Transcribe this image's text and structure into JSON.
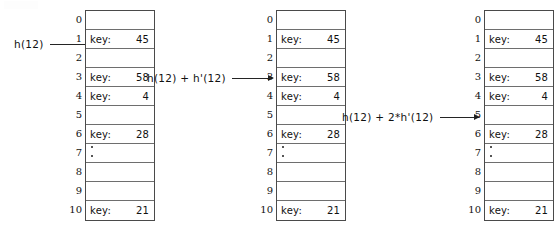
{
  "diagram": {
    "slot_label": "key:",
    "ink_color": "#111111",
    "border_color": "#4a4a4a",
    "background_color": "#ffffff"
  },
  "tables": [
    {
      "name": "hash-table-step-1",
      "slots": [
        {
          "index": "0",
          "key": "",
          "empty": true,
          "dots": false
        },
        {
          "index": "1",
          "key": "45",
          "empty": false,
          "dots": false
        },
        {
          "index": "2",
          "key": "",
          "empty": true,
          "dots": false
        },
        {
          "index": "3",
          "key": "58",
          "empty": false,
          "dots": false
        },
        {
          "index": "4",
          "key": "4",
          "empty": false,
          "dots": false
        },
        {
          "index": "5",
          "key": "",
          "empty": true,
          "dots": false
        },
        {
          "index": "6",
          "key": "28",
          "empty": false,
          "dots": false
        },
        {
          "index": "7",
          "key": "",
          "empty": true,
          "dots": true
        },
        {
          "index": "8",
          "key": "",
          "empty": true,
          "dots": false
        },
        {
          "index": "9",
          "key": "",
          "empty": true,
          "dots": false
        },
        {
          "index": "10",
          "key": "21",
          "empty": false,
          "dots": false
        }
      ]
    },
    {
      "name": "hash-table-step-2",
      "slots": [
        {
          "index": "0",
          "key": "",
          "empty": true,
          "dots": false
        },
        {
          "index": "1",
          "key": "45",
          "empty": false,
          "dots": false
        },
        {
          "index": "2",
          "key": "",
          "empty": true,
          "dots": false
        },
        {
          "index": "3",
          "key": "58",
          "empty": false,
          "dots": false
        },
        {
          "index": "4",
          "key": "4",
          "empty": false,
          "dots": false
        },
        {
          "index": "5",
          "key": "",
          "empty": true,
          "dots": false
        },
        {
          "index": "6",
          "key": "28",
          "empty": false,
          "dots": false
        },
        {
          "index": "7",
          "key": "",
          "empty": true,
          "dots": true
        },
        {
          "index": "8",
          "key": "",
          "empty": true,
          "dots": false
        },
        {
          "index": "9",
          "key": "",
          "empty": true,
          "dots": false
        },
        {
          "index": "10",
          "key": "21",
          "empty": false,
          "dots": false
        }
      ]
    },
    {
      "name": "hash-table-step-3",
      "slots": [
        {
          "index": "0",
          "key": "",
          "empty": true,
          "dots": false
        },
        {
          "index": "1",
          "key": "45",
          "empty": false,
          "dots": false
        },
        {
          "index": "2",
          "key": "",
          "empty": true,
          "dots": false
        },
        {
          "index": "3",
          "key": "58",
          "empty": false,
          "dots": false
        },
        {
          "index": "4",
          "key": "4",
          "empty": false,
          "dots": false
        },
        {
          "index": "5",
          "key": "",
          "empty": true,
          "dots": false
        },
        {
          "index": "6",
          "key": "28",
          "empty": false,
          "dots": false
        },
        {
          "index": "7",
          "key": "",
          "empty": true,
          "dots": true
        },
        {
          "index": "8",
          "key": "",
          "empty": true,
          "dots": false
        },
        {
          "index": "9",
          "key": "",
          "empty": true,
          "dots": false
        },
        {
          "index": "10",
          "key": "21",
          "empty": false,
          "dots": false
        }
      ]
    }
  ],
  "probes": [
    {
      "name": "probe-1",
      "text": "h(12)",
      "target_index": "1"
    },
    {
      "name": "probe-2",
      "text": "h(12) + h'(12)",
      "target_index": "3"
    },
    {
      "name": "probe-3",
      "text": "h(12) + 2*h'(12)",
      "target_index": "5"
    }
  ]
}
